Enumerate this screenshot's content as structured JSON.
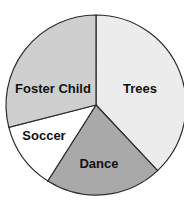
{
  "chart_data": {
    "type": "pie",
    "title": "",
    "start_angle_deg": 0,
    "direction": "clockwise",
    "categories": [
      "Trees",
      "Dance",
      "Soccer",
      "Foster Child"
    ],
    "values": [
      38,
      21,
      12,
      29
    ],
    "unit": "percent (estimated from slice angles)",
    "slices": [
      {
        "label": "Trees",
        "value": 38,
        "color": "#ececec",
        "label_x": 140,
        "label_y": 90
      },
      {
        "label": "Dance",
        "value": 21,
        "color": "#a9a9a9",
        "label_x": 99,
        "label_y": 165
      },
      {
        "label": "Soccer",
        "value": 12,
        "color": "#ffffff",
        "label_x": 44,
        "label_y": 137
      },
      {
        "label": "Foster Child",
        "value": 29,
        "color": "#cfcfcf",
        "label_x": 53,
        "label_y": 90
      }
    ],
    "legend": "none (labels inside slices)",
    "center": [
      96,
      105
    ],
    "radius": 90
  }
}
